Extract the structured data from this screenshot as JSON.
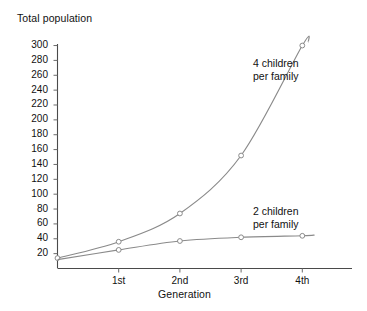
{
  "chart_data": {
    "type": "line",
    "title": "",
    "ylabel": "Total population",
    "xlabel": "Generation",
    "categories": [
      "0",
      "1st",
      "2nd",
      "3rd",
      "4th"
    ],
    "x_tick_labels": [
      "1st",
      "2nd",
      "3rd",
      "4th"
    ],
    "y_tick_labels": [
      "300",
      "280",
      "260",
      "240",
      "220",
      "200",
      "180",
      "160",
      "140",
      "120",
      "100",
      "80",
      "60",
      "40",
      "20"
    ],
    "y_tick_values": [
      300,
      280,
      260,
      240,
      220,
      200,
      180,
      160,
      140,
      120,
      100,
      80,
      60,
      40,
      20
    ],
    "ylim": [
      0,
      310
    ],
    "xlim": [
      0,
      4.2
    ],
    "grid": false,
    "legend_position": "inline-right",
    "series": [
      {
        "name": "4 children per family",
        "label_line_1": "4 children",
        "label_line_2": "per family",
        "color": "#8a8a8a",
        "x": [
          0,
          1,
          2,
          3,
          4,
          4.1
        ],
        "values": [
          14,
          36,
          74,
          152,
          300,
          305
        ],
        "markers": [
          0,
          1,
          2,
          3,
          4
        ]
      },
      {
        "name": "2 children per family",
        "label_line_1": "2 children",
        "label_line_2": "per family",
        "color": "#8a8a8a",
        "x": [
          0,
          1,
          2,
          3,
          4,
          4.2
        ],
        "values": [
          12,
          25,
          37,
          42,
          44,
          45
        ],
        "markers": [
          1,
          2,
          3,
          4
        ]
      }
    ]
  },
  "axes": {
    "y_title": "Total population",
    "x_title": "Generation"
  }
}
